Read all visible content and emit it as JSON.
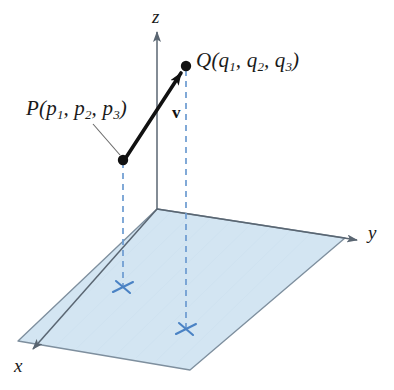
{
  "figure": {
    "background_color": "#ffffff"
  },
  "axes": {
    "z": {
      "label": "z",
      "direction": "up"
    },
    "y": {
      "label": "y",
      "direction": "right"
    },
    "x": {
      "label": "x",
      "direction": "lower-left"
    },
    "color": "#5a6672"
  },
  "plane": {
    "name": "xy-plane",
    "fill_color": "#d3e5f2",
    "edge_color": "#7e8f9e"
  },
  "points": {
    "P": {
      "name": "P",
      "label_text": "P(",
      "label_full": "P(p1, p2, p3)",
      "coords": [
        "p",
        "p",
        "p"
      ],
      "subscripts": [
        "1",
        "2",
        "3"
      ],
      "dot_color": "#111111"
    },
    "Q": {
      "name": "Q",
      "label_text": "Q(",
      "label_full": "Q(q1, q2, q3)",
      "coords": [
        "q",
        "q",
        "q"
      ],
      "subscripts": [
        "1",
        "2",
        "3"
      ],
      "dot_color": "#111111"
    }
  },
  "vector": {
    "label": "v",
    "from": "P",
    "to": "Q",
    "color": "#111111",
    "style": "bold-arrow"
  },
  "projections": {
    "color": "#6b9bd1",
    "style": "dashed",
    "markers": [
      {
        "name": "projection-marker-p",
        "glyph": "cross"
      },
      {
        "name": "projection-marker-q",
        "glyph": "cross"
      }
    ]
  },
  "leader_line": {
    "name": "p-label-leader",
    "color": "#6b6b6b"
  }
}
